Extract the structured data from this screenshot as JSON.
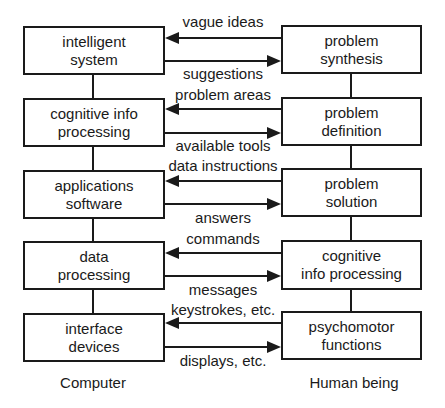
{
  "diagram": {
    "computer": {
      "caption": "Computer",
      "boxes": [
        {
          "line1": "intelligent",
          "line2": "system"
        },
        {
          "line1": "cognitive info",
          "line2": "processing"
        },
        {
          "line1": "applications",
          "line2": "software"
        },
        {
          "line1": "data",
          "line2": "processing"
        },
        {
          "line1": "interface",
          "line2": "devices"
        }
      ]
    },
    "human": {
      "caption": "Human being",
      "boxes": [
        {
          "line1": "problem",
          "line2": "synthesis"
        },
        {
          "line1": "problem",
          "line2": "definition"
        },
        {
          "line1": "problem",
          "line2": "solution"
        },
        {
          "line1": "cognitive",
          "line2": "info processing"
        },
        {
          "line1": "psychomotor",
          "line2": "functions"
        }
      ]
    },
    "flows": [
      {
        "to_computer": "vague ideas",
        "to_human": "suggestions"
      },
      {
        "to_computer": "problem areas",
        "to_human": "available tools"
      },
      {
        "to_computer": "data instructions",
        "to_human": "answers"
      },
      {
        "to_computer": "commands",
        "to_human": "messages"
      },
      {
        "to_computer": "keystrokes, etc.",
        "to_human": "displays, etc."
      }
    ]
  }
}
